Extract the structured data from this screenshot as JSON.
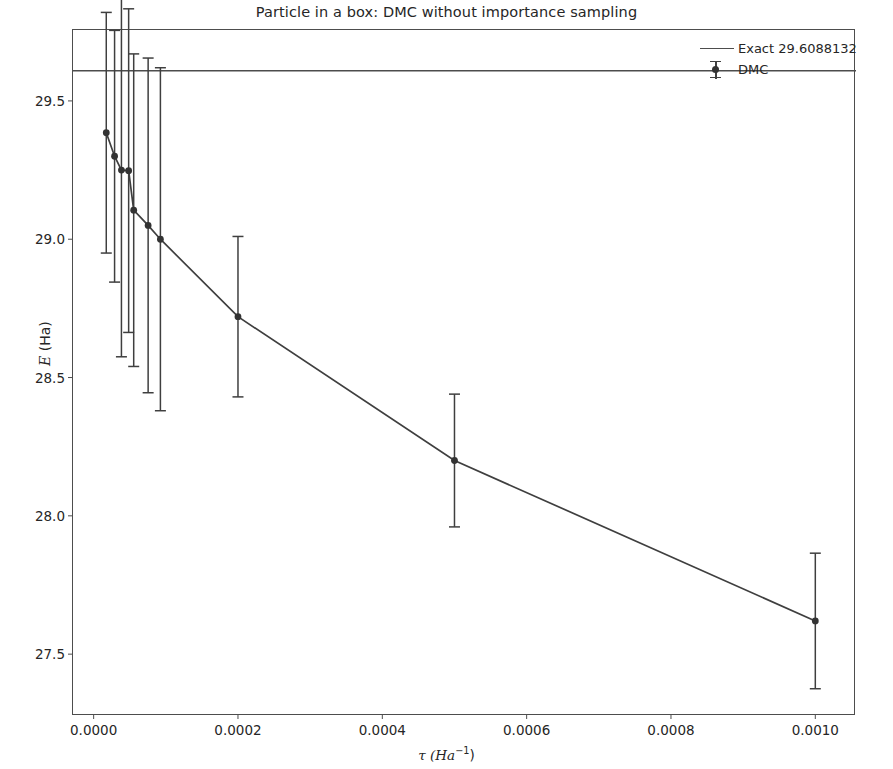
{
  "figure": {
    "title": "Particle in a box: DMC without importance sampling",
    "xlabel_main": "τ (Ha",
    "xlabel_sup": "−1",
    "xlabel_tail": ")",
    "ylabel_italic": "E",
    "ylabel_tail": " (Ha)"
  },
  "legend": {
    "entries": [
      {
        "label": "Exact 29.6088132",
        "style": "line"
      },
      {
        "label": "DMC",
        "style": "errorbar"
      }
    ]
  },
  "chart_data": {
    "type": "line",
    "title": "Particle in a box: DMC without importance sampling",
    "xlabel": "τ (Ha⁻¹)",
    "ylabel": "E (Ha)",
    "xlim": [
      -3e-05,
      0.001055
    ],
    "ylim": [
      27.28,
      29.76
    ],
    "grid": false,
    "legend_position": "upper right",
    "xticks": [
      0.0,
      0.0002,
      0.0004,
      0.0006,
      0.0008,
      0.001
    ],
    "xtick_labels": [
      "0.0000",
      "0.0002",
      "0.0004",
      "0.0006",
      "0.0008",
      "0.0010"
    ],
    "yticks": [
      29.5,
      29.0,
      28.5,
      28.0,
      27.5
    ],
    "ytick_labels": [
      "29.5",
      "29.0",
      "28.5",
      "28.0",
      "27.5"
    ],
    "reference_line": {
      "name": "Exact",
      "value": 29.6088132,
      "label": "Exact 29.6088132"
    },
    "series": [
      {
        "name": "DMC",
        "type": "errorbar",
        "x": [
          1.75e-05,
          2.9e-05,
          3.85e-05,
          4.85e-05,
          5.55e-05,
          7.55e-05,
          9.25e-05,
          0.0002,
          0.0005,
          0.001
        ],
        "y": [
          29.385,
          29.3,
          29.25,
          29.248,
          29.105,
          29.05,
          29.0,
          28.72,
          28.2,
          27.62
        ],
        "yerr": [
          0.435,
          0.455,
          0.675,
          0.585,
          0.565,
          0.605,
          0.62,
          0.29,
          0.24,
          0.245
        ]
      }
    ]
  }
}
